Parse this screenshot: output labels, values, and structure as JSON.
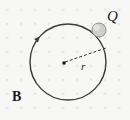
{
  "figure": {
    "background_color": "#f7f7f5",
    "width": 130,
    "height": 120
  },
  "field": {
    "symbol": "×",
    "meaning": "magnetic-field-into-page",
    "color": "#c9c9c9",
    "label": "B",
    "grid": {
      "spacing_px": 14,
      "origin_x": 7,
      "origin_y": 9,
      "cols": 9,
      "rows": 9
    }
  },
  "orbit": {
    "center_x": 68,
    "center_y": 62,
    "radius": 38,
    "stroke_color": "#3a3a3a",
    "stroke_width": 1.4,
    "direction": "clockwise",
    "arrow_angle_deg": 222
  },
  "charge": {
    "label": "Q",
    "x": 99,
    "y": 30,
    "radius": 7,
    "fill_color": "#cfcfcf",
    "stroke_color": "#8a8a8a"
  },
  "center_point": {
    "x": 64,
    "y": 63,
    "size": 3,
    "color": "#111111"
  },
  "radius_line": {
    "label": "r",
    "from_x": 65,
    "from_y": 62,
    "to_x": 106,
    "to_y": 48,
    "dash": "3 2",
    "color": "#333333"
  },
  "labels": {
    "charge": "Q",
    "field": "B",
    "radius": "r"
  }
}
